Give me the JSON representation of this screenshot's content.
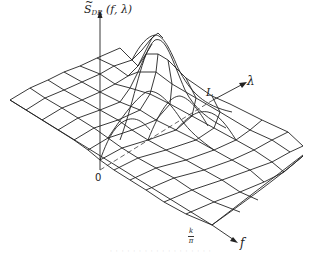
{
  "figure": {
    "type": "3d-surface-plot",
    "axes": {
      "vertical": {
        "symbol": "S",
        "accent": "~",
        "subscript": "DR",
        "args": "(f, λ)"
      },
      "lambda_axis": {
        "label": "λ",
        "marker": "L"
      },
      "f_axis": {
        "label": "f",
        "marker_num": "k",
        "marker_den": "π"
      },
      "origin": "0"
    },
    "footer_bleed_text": "· · · ·  · · · ·  · · ·  · · ·  · · · ·"
  },
  "colors": {
    "ink": "#222222",
    "background": "#ffffff",
    "dashed": "#555555"
  }
}
